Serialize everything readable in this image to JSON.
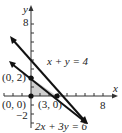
{
  "diagram": {
    "axes": {
      "x_label": "x",
      "y_label": "y",
      "x_tick_label": "8",
      "y_tick_label": "8",
      "y_neg_tick_label": "−2"
    },
    "lines": [
      {
        "equation": "x + y = 4",
        "color": "#111111"
      },
      {
        "equation": "2x + 3y = 6",
        "color": "#111111"
      }
    ],
    "points": [
      {
        "label": "(0, 2)",
        "x": 0,
        "y": 2
      },
      {
        "label": "(0, 0)",
        "x": 0,
        "y": 0
      },
      {
        "label": "(3, 0)",
        "x": 3,
        "y": 0
      }
    ],
    "region": {
      "description": "feasible region triangle (0,0),(0,2),(3,0)",
      "fill": "#c8c8c8"
    }
  }
}
